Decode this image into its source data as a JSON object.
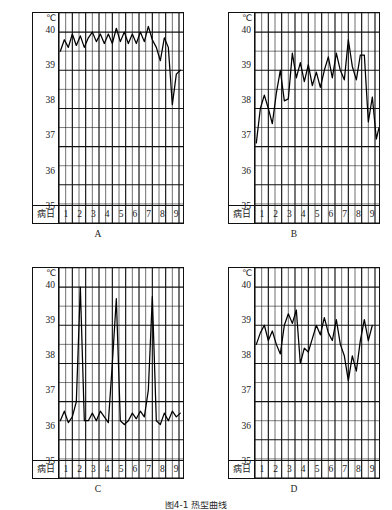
{
  "figure": {
    "caption": "图4-1  热型曲线",
    "axis": {
      "unit_symbol": "℃",
      "y_label_unit": "℃",
      "y_ticks": [
        "40",
        "39",
        "38",
        "37",
        "36",
        "35"
      ],
      "y_min": 35,
      "y_max": 40.5,
      "x_axis_label": "病日",
      "x_ticks": [
        "1",
        "2",
        "3",
        "4",
        "5",
        "6",
        "7",
        "8",
        "9"
      ],
      "minor_rows_per_degree": 2,
      "minor_cols_per_day": 2,
      "grid": true
    }
  },
  "chart_data": [
    {
      "id": "A",
      "type": "line",
      "panel_letter": "A",
      "title": "",
      "xlabel": "病日",
      "ylabel": "℃",
      "ylim": [
        35,
        40.5
      ],
      "xlim": [
        0.5,
        9.8
      ],
      "fever_type": "稽留热",
      "x": [
        0.6,
        0.9,
        1.2,
        1.5,
        1.8,
        2.1,
        2.4,
        2.7,
        3.0,
        3.3,
        3.6,
        3.9,
        4.2,
        4.5,
        4.8,
        5.1,
        5.4,
        5.7,
        6.0,
        6.3,
        6.6,
        6.9,
        7.2,
        7.5,
        7.8,
        8.1,
        8.4,
        8.7,
        9.0,
        9.3,
        9.6
      ],
      "values": [
        39.5,
        39.8,
        39.6,
        39.95,
        39.65,
        39.9,
        39.6,
        39.85,
        40.0,
        39.75,
        39.95,
        39.7,
        39.95,
        39.7,
        40.1,
        39.75,
        40.0,
        39.7,
        39.95,
        39.7,
        40.0,
        39.75,
        40.15,
        39.8,
        39.6,
        39.25,
        39.85,
        39.6,
        38.1,
        38.9,
        39.0
      ]
    },
    {
      "id": "B",
      "type": "line",
      "panel_letter": "B",
      "title": "",
      "xlabel": "病日",
      "ylabel": "℃",
      "ylim": [
        35,
        40.5
      ],
      "xlim": [
        0.5,
        9.8
      ],
      "fever_type": "弛张热",
      "x": [
        0.6,
        0.9,
        1.2,
        1.5,
        1.8,
        2.1,
        2.4,
        2.7,
        3.0,
        3.3,
        3.6,
        3.9,
        4.2,
        4.5,
        4.8,
        5.1,
        5.4,
        5.7,
        6.0,
        6.3,
        6.6,
        6.9,
        7.2,
        7.5,
        7.8,
        8.1,
        8.4,
        8.7,
        9.0,
        9.3,
        9.6
      ],
      "values": [
        37.1,
        38.0,
        38.35,
        38.0,
        37.6,
        38.4,
        39.0,
        38.2,
        38.25,
        39.45,
        38.8,
        39.2,
        38.7,
        39.15,
        38.6,
        38.95,
        38.55,
        39.0,
        39.35,
        38.8,
        39.45,
        39.0,
        38.75,
        39.8,
        39.1,
        38.75,
        39.4,
        39.4,
        37.65,
        38.3,
        37.2,
        37.5
      ]
    },
    {
      "id": "C",
      "type": "line",
      "panel_letter": "C",
      "title": "",
      "xlabel": "病日",
      "ylabel": "℃",
      "ylim": [
        35,
        40.5
      ],
      "xlim": [
        0.5,
        9.8
      ],
      "fever_type": "间歇热",
      "x": [
        0.6,
        0.9,
        1.2,
        1.5,
        1.8,
        2.1,
        2.4,
        2.7,
        3.0,
        3.3,
        3.6,
        3.9,
        4.2,
        4.5,
        4.8,
        5.1,
        5.4,
        5.7,
        6.0,
        6.3,
        6.6,
        6.9,
        7.2,
        7.5,
        7.8,
        8.1,
        8.4,
        8.7,
        9.0,
        9.3,
        9.6
      ],
      "values": [
        36.5,
        36.75,
        36.45,
        36.6,
        37.0,
        40.0,
        36.5,
        36.5,
        36.7,
        36.5,
        36.75,
        36.6,
        36.45,
        38.0,
        39.7,
        36.5,
        36.4,
        36.5,
        36.7,
        36.55,
        36.75,
        36.6,
        37.3,
        39.75,
        36.5,
        36.4,
        36.7,
        36.5,
        36.75,
        36.6,
        36.7
      ]
    },
    {
      "id": "D",
      "type": "line",
      "panel_letter": "D",
      "title": "",
      "xlabel": "病日",
      "ylabel": "℃",
      "ylim": [
        35,
        40.5
      ],
      "xlim": [
        0.5,
        9.8
      ],
      "fever_type": "不规则热",
      "x": [
        0.6,
        0.9,
        1.2,
        1.5,
        1.8,
        2.1,
        2.4,
        2.7,
        3.0,
        3.3,
        3.6,
        3.9,
        4.2,
        4.5,
        4.8,
        5.1,
        5.4,
        5.7,
        6.0,
        6.3,
        6.6,
        6.9,
        7.2,
        7.5,
        7.8,
        8.1,
        8.4,
        8.7,
        9.0,
        9.3,
        9.6
      ],
      "values": [
        38.5,
        38.8,
        39.0,
        38.6,
        38.85,
        38.5,
        38.25,
        39.0,
        39.3,
        39.05,
        39.4,
        38.0,
        38.4,
        38.3,
        38.65,
        39.0,
        38.75,
        39.2,
        38.8,
        38.6,
        39.15,
        38.5,
        38.2,
        37.55,
        38.2,
        37.8,
        38.6,
        39.15,
        38.6,
        39.0
      ]
    }
  ]
}
